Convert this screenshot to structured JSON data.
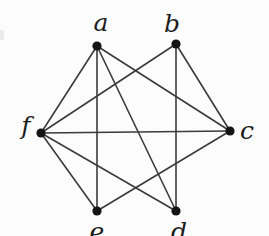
{
  "figure": {
    "width": 269,
    "height": 236,
    "background_color": "#fcfcfc",
    "artifact": {
      "x": 0,
      "y": 30,
      "width": 4,
      "height": 10,
      "color": "#ebebeb"
    }
  },
  "diagram": {
    "type": "undirected-graph",
    "style": {
      "edge_color": "#3b3b3b",
      "edge_width": 1.6,
      "node_color": "#141414",
      "node_radius": 4.6,
      "label_font_size": 25
    },
    "nodes": [
      {
        "id": "a",
        "label": "a",
        "x": 97,
        "y": 46,
        "label_x": 101,
        "label_y": 31
      },
      {
        "id": "b",
        "label": "b",
        "x": 176,
        "y": 44,
        "label_x": 172,
        "label_y": 32
      },
      {
        "id": "c",
        "label": "c",
        "x": 230,
        "y": 131,
        "label_x": 247,
        "label_y": 139
      },
      {
        "id": "d",
        "label": "d",
        "x": 176,
        "y": 211,
        "label_x": 179,
        "label_y": 240
      },
      {
        "id": "e",
        "label": "e",
        "x": 97,
        "y": 211,
        "label_x": 97,
        "label_y": 240
      },
      {
        "id": "f",
        "label": "f",
        "x": 41,
        "y": 133,
        "label_x": 26,
        "label_y": 134
      }
    ],
    "edges": [
      [
        "a",
        "c"
      ],
      [
        "a",
        "d"
      ],
      [
        "a",
        "e"
      ],
      [
        "a",
        "f"
      ],
      [
        "b",
        "c"
      ],
      [
        "b",
        "d"
      ],
      [
        "b",
        "f"
      ],
      [
        "c",
        "e"
      ],
      [
        "c",
        "f"
      ],
      [
        "d",
        "f"
      ],
      [
        "e",
        "f"
      ]
    ]
  }
}
